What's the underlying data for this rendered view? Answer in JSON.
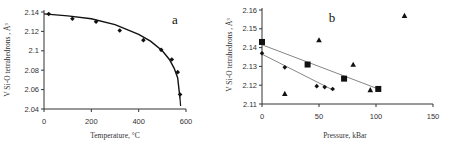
{
  "chart_data": [
    {
      "panel": "a",
      "type": "scatter",
      "title": "a",
      "xlabel": "Temperature, °C",
      "ylabel": "V Si-O tetrahedrons , Å³",
      "xlim": [
        0,
        600
      ],
      "ylim": [
        2.04,
        2.14
      ],
      "xticks": [
        "0",
        "200",
        "400",
        "600"
      ],
      "yticks": [
        "2.04",
        "2.06",
        "2.08",
        "2.1",
        "2.12",
        "2.14"
      ],
      "grid": false,
      "series": [
        {
          "name": "data",
          "marker": "diamond",
          "x": [
            20,
            120,
            220,
            320,
            420,
            495,
            540,
            565,
            575
          ],
          "y": [
            2.138,
            2.133,
            2.13,
            2.121,
            2.111,
            2.101,
            2.091,
            2.078,
            2.055
          ]
        },
        {
          "name": "fit",
          "style": "curve",
          "x": [
            0,
            100,
            200,
            300,
            400,
            450,
            500,
            530,
            550,
            565,
            575
          ],
          "y": [
            2.138,
            2.136,
            2.133,
            2.127,
            2.117,
            2.11,
            2.1,
            2.091,
            2.082,
            2.072,
            2.05
          ]
        }
      ]
    },
    {
      "panel": "b",
      "type": "scatter",
      "title": "b",
      "xlabel": "Pressure, kBar",
      "ylabel": "V Si-O tetrahedrons , Å³",
      "xlim": [
        0,
        150
      ],
      "ylim": [
        2.11,
        2.16
      ],
      "xticks": [
        "0",
        "50",
        "100",
        "150"
      ],
      "yticks": [
        "2.11",
        "2.12",
        "2.13",
        "2.14",
        "2.15",
        "2.16"
      ],
      "grid": false,
      "series": [
        {
          "name": "squares",
          "marker": "square",
          "x": [
            0,
            40,
            72,
            102
          ],
          "y": [
            2.143,
            2.131,
            2.1235,
            2.118
          ],
          "trendline": {
            "x": [
              0,
              102
            ],
            "y": [
              2.1415,
              2.118
            ]
          }
        },
        {
          "name": "diamonds",
          "marker": "diamond",
          "x": [
            0,
            20,
            48,
            55,
            62
          ],
          "y": [
            2.137,
            2.1295,
            2.1195,
            2.119,
            2.118
          ],
          "trendline": {
            "x": [
              0,
              62
            ],
            "y": [
              2.1365,
              2.1175
            ]
          }
        },
        {
          "name": "triangles",
          "marker": "triangle",
          "x": [
            20,
            50,
            80,
            95,
            125
          ],
          "y": [
            2.1155,
            2.144,
            2.131,
            2.1175,
            2.157
          ]
        }
      ]
    }
  ]
}
